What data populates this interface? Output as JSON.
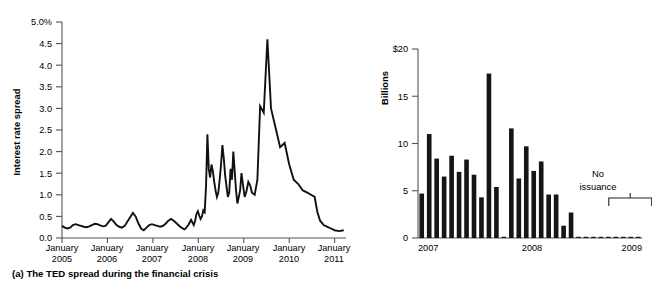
{
  "figure": {
    "panels": [
      {
        "id": "a",
        "caption": "(a) The TED spread during the financial crisis"
      },
      {
        "id": "b",
        "caption": "(b) Issuance of new securities backed by credit cards"
      }
    ]
  },
  "chart_data": [
    {
      "type": "line",
      "panel": "a",
      "title": "(a) The TED spread during the financial crisis",
      "xlabel": "",
      "ylabel": "Interest rate spread",
      "ylim": [
        0.0,
        5.0
      ],
      "yticks": [
        0.0,
        0.5,
        1.0,
        1.5,
        2.0,
        2.5,
        3.0,
        3.5,
        4.0,
        4.5,
        5.0
      ],
      "ytick_labels": [
        "0.0",
        "0.5",
        "1.0",
        "1.5",
        "2.0",
        "2.5",
        "3.0",
        "3.5",
        "4.0",
        "4.5",
        "5.0%"
      ],
      "xlim": [
        2005.0,
        2011.25
      ],
      "xticks": [
        2005,
        2006,
        2007,
        2008,
        2009,
        2010,
        2011
      ],
      "xtick_labels": [
        [
          "January",
          "2005"
        ],
        [
          "January",
          "2006"
        ],
        [
          "January",
          "2007"
        ],
        [
          "January",
          "2008"
        ],
        [
          "January",
          "2009"
        ],
        [
          "January",
          "2010"
        ],
        [
          "January",
          "2011"
        ]
      ],
      "grid": false,
      "legend": "none",
      "series": [
        {
          "name": "TED spread",
          "color": "#111111",
          "x": [
            2005.0,
            2005.06,
            2005.12,
            2005.18,
            2005.24,
            2005.3,
            2005.36,
            2005.42,
            2005.48,
            2005.54,
            2005.6,
            2005.66,
            2005.72,
            2005.78,
            2005.84,
            2005.9,
            2005.96,
            2006.02,
            2006.08,
            2006.14,
            2006.2,
            2006.26,
            2006.32,
            2006.38,
            2006.44,
            2006.5,
            2006.56,
            2006.62,
            2006.68,
            2006.74,
            2006.8,
            2006.86,
            2006.92,
            2006.98,
            2007.04,
            2007.1,
            2007.16,
            2007.22,
            2007.28,
            2007.34,
            2007.4,
            2007.46,
            2007.52,
            2007.56,
            2007.6,
            2007.63,
            2007.66,
            2007.69,
            2007.72,
            2007.75,
            2007.78,
            2007.81,
            2007.84,
            2007.87,
            2007.9,
            2007.93,
            2007.96,
            2007.99,
            2008.02,
            2008.05,
            2008.08,
            2008.11,
            2008.14,
            2008.17,
            2008.2,
            2008.23,
            2008.26,
            2008.29,
            2008.32,
            2008.35,
            2008.38,
            2008.41,
            2008.44,
            2008.47,
            2008.5,
            2008.53,
            2008.56,
            2008.59,
            2008.62,
            2008.65,
            2008.68,
            2008.71,
            2008.74,
            2008.77,
            2008.8,
            2008.83,
            2008.86,
            2008.89,
            2008.92,
            2008.95,
            2008.98,
            2009.02,
            2009.06,
            2009.1,
            2009.14,
            2009.18,
            2009.24,
            2009.3,
            2009.36,
            2009.44,
            2009.52,
            2009.6,
            2009.7,
            2009.8,
            2009.9,
            2010.0,
            2010.1,
            2010.2,
            2010.3,
            2010.4,
            2010.48,
            2010.56,
            2010.62,
            2010.68,
            2010.76,
            2010.84,
            2010.92,
            2011.0,
            2011.1,
            2011.2
          ],
          "y": [
            0.28,
            0.24,
            0.22,
            0.24,
            0.3,
            0.32,
            0.3,
            0.28,
            0.26,
            0.25,
            0.27,
            0.3,
            0.33,
            0.32,
            0.29,
            0.27,
            0.28,
            0.36,
            0.44,
            0.38,
            0.3,
            0.26,
            0.24,
            0.28,
            0.38,
            0.48,
            0.58,
            0.5,
            0.34,
            0.22,
            0.18,
            0.24,
            0.3,
            0.32,
            0.3,
            0.28,
            0.26,
            0.28,
            0.33,
            0.4,
            0.44,
            0.4,
            0.34,
            0.3,
            0.26,
            0.24,
            0.22,
            0.2,
            0.22,
            0.26,
            0.3,
            0.36,
            0.42,
            0.36,
            0.3,
            0.4,
            0.56,
            0.62,
            0.52,
            0.44,
            0.5,
            0.64,
            0.6,
            1.2,
            2.4,
            1.6,
            1.4,
            1.7,
            1.55,
            1.3,
            1.1,
            0.95,
            1.05,
            1.35,
            1.7,
            2.15,
            1.85,
            1.45,
            1.2,
            0.95,
            1.05,
            1.6,
            1.35,
            2.0,
            1.55,
            1.1,
            0.8,
            0.95,
            1.1,
            1.5,
            1.25,
            0.95,
            1.08,
            1.3,
            1.22,
            1.05,
            1.0,
            1.35,
            3.05,
            2.9,
            4.6,
            3.0,
            2.55,
            2.1,
            2.2,
            1.7,
            1.35,
            1.25,
            1.1,
            1.05,
            1.0,
            0.95,
            0.6,
            0.4,
            0.3,
            0.26,
            0.22,
            0.18,
            0.16,
            0.18
          ],
          "y_extended": [
            0.24,
            0.18,
            0.14,
            0.12,
            0.16,
            0.3,
            0.5,
            0.62,
            0.48,
            0.32,
            0.26,
            0.22,
            0.24,
            0.26,
            0.25,
            0.22
          ]
        }
      ]
    },
    {
      "type": "bar",
      "panel": "b",
      "title": "(b) Issuance of new securities backed by credit cards",
      "xlabel": "",
      "ylabel": "Billions",
      "ylim": [
        0,
        20
      ],
      "yticks": [
        0,
        5,
        10,
        15,
        20
      ],
      "ytick_labels": [
        "0",
        "5",
        "10",
        "15",
        "$20"
      ],
      "xticks": [
        2007,
        2008,
        2009
      ],
      "xtick_labels": [
        "2007",
        "2008",
        "2009"
      ],
      "grid": false,
      "legend": "none",
      "annotation": {
        "text_line1": "No",
        "text_line2": "issuance",
        "bracket_start_index": 26,
        "bracket_end_index": 31
      },
      "categories": [
        "2007-M1",
        "2007-M2",
        "2007-M3",
        "2007-M4",
        "2007-M5",
        "2007-M6",
        "2007-M7",
        "2007-M8",
        "2007-M9",
        "2007-M10",
        "2007-M11",
        "2007-M12",
        "2008-M1",
        "2008-M2",
        "2008-M3",
        "2008-M4",
        "2008-M5",
        "2008-M6",
        "2008-M7",
        "2008-M8",
        "2008-M9",
        "2008-M10",
        "2008-M11",
        "2008-M12",
        "2009-M1",
        "2009-M2",
        "2009-M3",
        "2009-M4",
        "2009-M5",
        "2009-M6"
      ],
      "values": [
        4.7,
        11.0,
        8.4,
        6.5,
        8.7,
        7.0,
        8.3,
        6.7,
        4.3,
        17.4,
        5.4,
        0.1,
        11.6,
        6.3,
        9.7,
        7.1,
        8.1,
        4.6,
        4.6,
        1.3,
        2.7,
        0.05,
        0.05,
        0.05,
        0.05,
        0.05,
        0.05,
        0.05,
        0.05,
        0.05
      ],
      "bar_color": "#151515"
    }
  ]
}
